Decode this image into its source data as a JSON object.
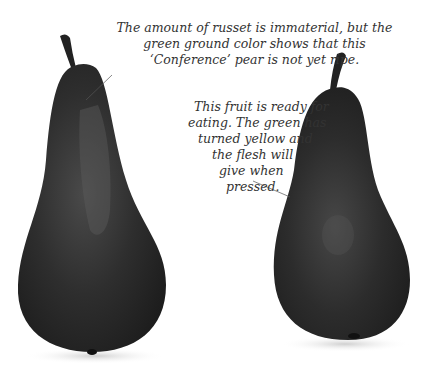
{
  "figure": {
    "background_color": "#ffffff",
    "pear_color": "#2a2a2a",
    "annotations": [
      {
        "id": "unripe-pear-note",
        "lines": [
          "The amount of russet is immaterial, but the",
          "green ground color shows that this",
          "‘Conference’ pear is not yet ripe."
        ]
      },
      {
        "id": "ripe-pear-note",
        "lines": [
          "This fruit is ready for",
          "eating. The green has",
          "turned yellow and",
          "the flesh will",
          "give when",
          "pressed."
        ]
      }
    ]
  }
}
